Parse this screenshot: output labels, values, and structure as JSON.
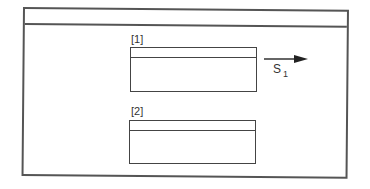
{
  "diagram": {
    "outer_frame": {
      "header": ""
    },
    "boxes": [
      {
        "id": "1",
        "label": "[1]"
      },
      {
        "id": "2",
        "label": "[2]"
      }
    ],
    "transition": {
      "label_main": "S",
      "label_sub": "1",
      "direction": "right"
    },
    "colors": {
      "line": "#444444",
      "background": "#ffffff",
      "text": "#333333"
    }
  }
}
